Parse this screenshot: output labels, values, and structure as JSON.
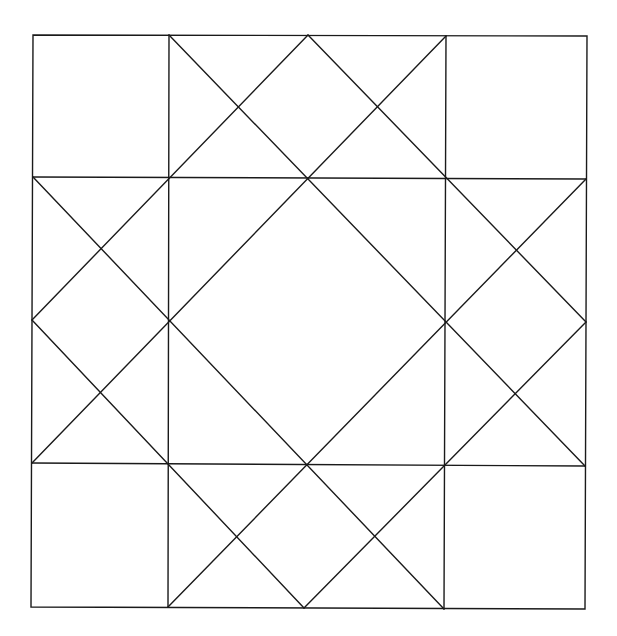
{
  "diagram": {
    "type": "quilt-block-line-drawing",
    "background": "#ffffff",
    "stroke_color": "#1a1a1a",
    "stroke_width": 1.4,
    "outer_frame": [
      [
        33,
        35
      ],
      [
        587,
        36
      ],
      [
        585,
        609
      ],
      [
        31,
        607
      ]
    ],
    "grid_lines": [
      {
        "name": "vertical-left",
        "x1": 169,
        "y1": 35,
        "x2": 168,
        "y2": 607
      },
      {
        "name": "vertical-right",
        "x1": 446,
        "y1": 36,
        "x2": 444,
        "y2": 609
      },
      {
        "name": "horizontal-top",
        "x1": 33,
        "y1": 177,
        "x2": 586,
        "y2": 179
      },
      {
        "name": "horizontal-bottom",
        "x1": 32,
        "y1": 463,
        "x2": 585,
        "y2": 466
      }
    ],
    "diagonal_lines": [
      {
        "name": "diag-top-left-to-right-lower",
        "x1": 169,
        "y1": 35,
        "x2": 585,
        "y2": 466
      },
      {
        "name": "diag-top-right-to-left-lower",
        "x1": 446,
        "y1": 36,
        "x2": 32,
        "y2": 463
      },
      {
        "name": "diag-topmid-to-leftmid",
        "x1": 308,
        "y1": 35,
        "x2": 32,
        "y2": 320
      },
      {
        "name": "diag-topmid-to-rightmid",
        "x1": 308,
        "y1": 35,
        "x2": 586,
        "y2": 322
      },
      {
        "name": "diag-leftmid-to-bottommid",
        "x1": 32,
        "y1": 320,
        "x2": 304,
        "y2": 608
      },
      {
        "name": "diag-rightmid-to-bottommid",
        "x1": 586,
        "y1": 322,
        "x2": 304,
        "y2": 608
      },
      {
        "name": "diag-left-upper-to-bottom-right",
        "x1": 33,
        "y1": 177,
        "x2": 444,
        "y2": 609
      },
      {
        "name": "diag-right-upper-to-bottom-left",
        "x1": 586,
        "y1": 179,
        "x2": 168,
        "y2": 607
      }
    ],
    "key_points": {
      "center_diamond": [
        [
          307,
          178
        ],
        [
          445,
          321
        ],
        [
          305,
          465
        ],
        [
          169,
          320
        ]
      ],
      "edge_midpoints": {
        "top": [
          308,
          35
        ],
        "right": [
          586,
          322
        ],
        "bottom": [
          304,
          608
        ],
        "left": [
          32,
          320
        ]
      }
    }
  }
}
